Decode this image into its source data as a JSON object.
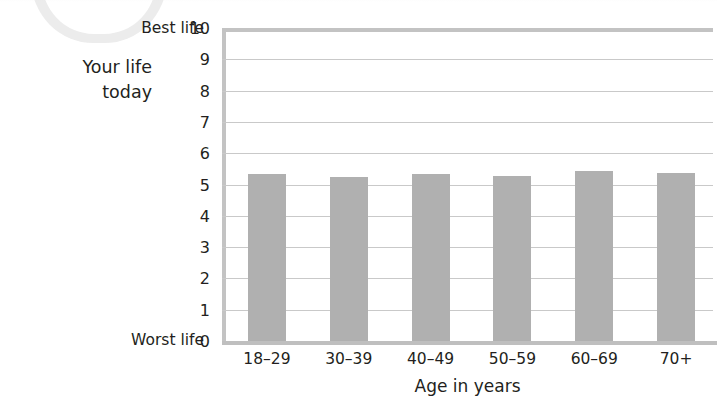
{
  "chart_data": {
    "type": "bar",
    "title": "",
    "subtitle": "",
    "categories": [
      "18–29",
      "30–39",
      "40–49",
      "50–59",
      "60–69",
      "70+"
    ],
    "values": [
      5.35,
      5.25,
      5.35,
      5.27,
      5.42,
      5.37
    ],
    "series": [
      {
        "name": "Your life today",
        "values": [
          5.35,
          5.25,
          5.35,
          5.27,
          5.42,
          5.37
        ]
      }
    ],
    "xlabel": "Age in years",
    "ylabel": "Your life today",
    "ylim": [
      0,
      10
    ],
    "yticks": [
      0,
      1,
      2,
      3,
      4,
      5,
      6,
      7,
      8,
      9,
      10
    ],
    "ytick_labels": [
      "0",
      "1",
      "2",
      "3",
      "4",
      "5",
      "6",
      "7",
      "8",
      "9",
      "10"
    ],
    "y_axis_endpoint_low": "Worst life",
    "y_axis_endpoint_high": "Best life",
    "grid": true,
    "legend": "none",
    "bar_color": "#b0b0b0",
    "gridline_color": "#c9c9c9",
    "axis_color": "#c3c3c3",
    "text_color": "#231f20"
  },
  "axis": {
    "y_caption_line1": "Your life",
    "y_caption_line2": "today",
    "best_life_label": "Best life",
    "worst_life_label": "Worst life",
    "x_title": "Age in years"
  }
}
